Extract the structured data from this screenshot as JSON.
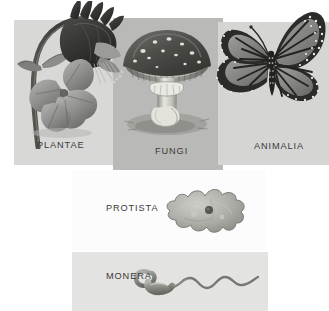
{
  "figure": {
    "background_color": "#ffffff"
  },
  "panels": [
    {
      "id": "plantae",
      "label": "PLANTAE",
      "organism": "columbine flower",
      "art_name": "columbine-flower-illustration",
      "background_color": "#d8d8d6",
      "row": "top",
      "column": 1
    },
    {
      "id": "fungi",
      "label": "FUNGI",
      "organism": "amanita mushroom",
      "art_name": "amanita-mushroom-illustration",
      "background_color": "#b9b9b7",
      "row": "top",
      "column": 2
    },
    {
      "id": "animalia",
      "label": "ANIMALIA",
      "organism": "monarch butterfly",
      "art_name": "monarch-butterfly-illustration",
      "background_color": "#d5d5d3",
      "row": "top",
      "column": 3
    },
    {
      "id": "protista",
      "label": "PROTISTA",
      "organism": "amoeba",
      "art_name": "amoeba-illustration",
      "background_color": "#fcfcfc",
      "row": "middle",
      "column": 1
    },
    {
      "id": "monera",
      "label": "MONERA",
      "organism": "bacterium with flagellum",
      "art_name": "bacterium-illustration",
      "background_color": "#e3e3e1",
      "row": "bottom",
      "column": 1
    }
  ],
  "palette": {
    "label_text": "#3a3a3a",
    "ink_dark": "#2e2e2e",
    "ink_mid": "#6e6e6c",
    "ink_light": "#a8a8a6"
  }
}
